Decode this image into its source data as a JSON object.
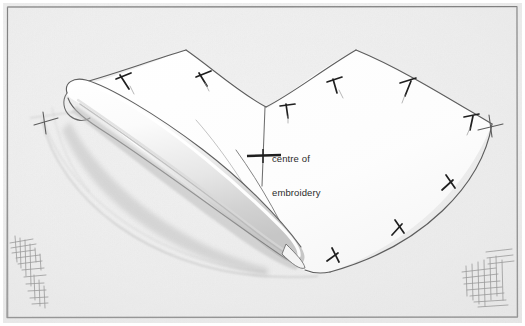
{
  "figure": {
    "kind": "hand-drawn-sewing-pattern-diagram",
    "title": "",
    "paper_color": "#efefef",
    "paper_border_color": "#8a8a8a",
    "ink_color": "#4a4a4a",
    "pencil_color": "#9a9a9a",
    "fabric_fill": "#fdfdfd",
    "annotations": [
      {
        "id": "centre-of-embroidery",
        "line1": "centre of",
        "line2": "embroidery",
        "text_color": "#2b2b2b",
        "marker": "crosshair",
        "marker_x": 263,
        "marker_y": 156,
        "leader_line": "vertical",
        "leader_top_y": 106,
        "leader_bottom_y": 186
      }
    ],
    "marks": {
      "notch_label": "notch",
      "notch_count": 9,
      "corner_cross_label": "corner registration cross",
      "corner_cross_count": 2,
      "corner_scribble_label": "pencil crosshatch scribble",
      "corner_scribble_count": 2
    },
    "pieces": [
      {
        "id": "main-pattern-piece",
        "label": "main pattern panel"
      },
      {
        "id": "rolled-fabric-edge",
        "label": "rolled fabric edge"
      },
      {
        "id": "pencil-guide-curve",
        "label": "pencil guide curve"
      }
    ]
  }
}
